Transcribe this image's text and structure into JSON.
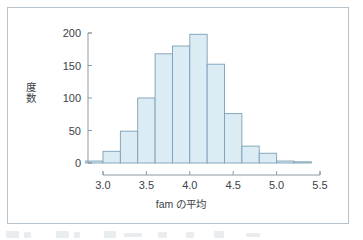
{
  "figure": {
    "frame_border_color": "#b9c3cc",
    "background": "#ffffff"
  },
  "chart_data": {
    "type": "bar",
    "title": "",
    "subtitle": "",
    "xlabel": "fam の平均",
    "ylabel": "度数",
    "ylabel_chars": [
      "度",
      "数"
    ],
    "xlim": [
      2.78,
      5.62
    ],
    "ylim": [
      0,
      205
    ],
    "grid": false,
    "legend": null,
    "bin_width": 0.2,
    "bar_fill_color": "#dcecf5",
    "bar_edge_color": "#7d9fb5",
    "axis_color": "#8d9aa5",
    "xticks": [
      3.0,
      3.5,
      4.0,
      4.5,
      5.0,
      5.5
    ],
    "xtick_labels": [
      "3.0",
      "3.5",
      "4.0",
      "4.5",
      "5.0",
      "5.5"
    ],
    "yticks": [
      0,
      50,
      100,
      150,
      200
    ],
    "ytick_labels": [
      "0",
      "50",
      "100",
      "150",
      "200"
    ],
    "bin_edges": [
      2.8,
      3.0,
      3.2,
      3.4,
      3.6,
      3.8,
      4.0,
      4.2,
      4.4,
      4.6,
      4.8,
      5.0,
      5.2,
      5.4
    ],
    "categories": [
      "2.8-3.0",
      "3.0-3.2",
      "3.2-3.4",
      "3.4-3.6",
      "3.6-3.8",
      "3.8-4.0",
      "4.0-4.2",
      "4.2-4.4",
      "4.4-4.6",
      "4.6-4.8",
      "4.8-5.0",
      "5.0-5.2",
      "5.2-5.4"
    ],
    "values": [
      3,
      18,
      49,
      100,
      168,
      180,
      198,
      152,
      76,
      26,
      15,
      3,
      1
    ]
  }
}
